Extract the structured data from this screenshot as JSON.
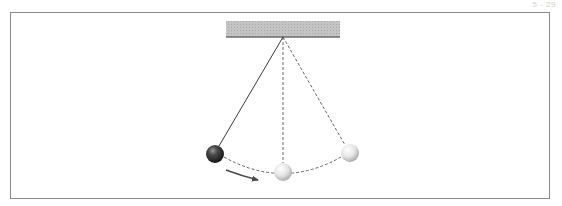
{
  "page": {
    "label": "5 - 29"
  },
  "diagram": {
    "colors": {
      "frame": "#8a8a8a",
      "ceiling_fill": "#bdbdbd",
      "ceiling_edge": "#6e6e6e",
      "string": "#3a3a3a",
      "dashed": "#555555",
      "arrow": "#4a4a4a",
      "bob_dark": "#1e1e1e",
      "bob_light": "#d8d8d8"
    },
    "ceiling": {
      "x": 226,
      "y": 21,
      "width": 114,
      "height": 16
    },
    "pivot": {
      "x": 283,
      "y": 37
    },
    "bobs": [
      {
        "name": "left-bob-start",
        "x": 215,
        "y": 154,
        "r": 9,
        "shade": "dark"
      },
      {
        "name": "middle-bob-bottom",
        "x": 283,
        "y": 172,
        "r": 9,
        "shade": "light"
      },
      {
        "name": "right-bob-end",
        "x": 350,
        "y": 153,
        "r": 9,
        "shade": "light"
      }
    ],
    "arrow": {
      "from": [
        226,
        170
      ],
      "to": [
        259,
        180
      ],
      "direction": "right"
    }
  }
}
